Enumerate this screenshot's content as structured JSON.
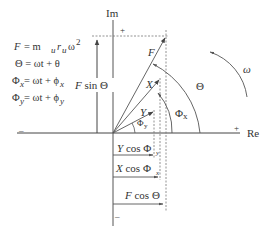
{
  "diagram": {
    "equations": [
      {
        "lhs": "F",
        "rhs": "= m",
        "sub1": "u",
        "mid": "r",
        "sub2": "u",
        "tail": "ω",
        "sup": "2"
      },
      {
        "text": "Θ = ωt + θ"
      },
      {
        "lhs": "Φ",
        "lhs_sub": "x",
        "rhs": " = ωt + ϕ",
        "rhs_sub": "x"
      },
      {
        "lhs": "Φ",
        "lhs_sub": "y",
        "rhs": " = ωt + ϕ",
        "rhs_sub": "y"
      }
    ],
    "axes": {
      "imaginary_label": "Im",
      "real_label": "Re",
      "plus_top": "+",
      "plus_right": "+",
      "minus_left": "–",
      "minus_bottom": "–"
    },
    "vectors": {
      "F": "F",
      "X": "X",
      "Y": "Y"
    },
    "angles": {
      "theta": "Θ",
      "phi_x": "Φ",
      "phi_x_sub": "x",
      "phi_y": "Φ",
      "phi_y_sub": "y",
      "omega": "ω"
    },
    "projections": {
      "f_sin_theta": "F sin Θ",
      "y_cos": "Y cos Φ",
      "y_cos_sub": "y",
      "x_cos": "X cos Φ",
      "x_cos_sub": "x",
      "f_cos": "F cos Θ"
    },
    "colors": {
      "stroke": "#444444",
      "dashed": "#777777",
      "text": "#333333"
    }
  }
}
